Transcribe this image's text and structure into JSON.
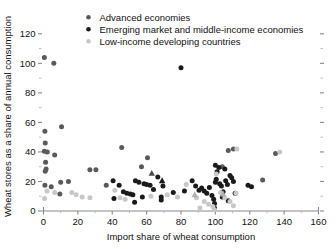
{
  "chart_data": {
    "type": "scatter",
    "title": "",
    "xlabel": "Import share of wheat consumption",
    "ylabel": "Wheat stores as a share of annual consumption",
    "xlim": [
      0,
      160
    ],
    "ylim": [
      0,
      128
    ],
    "xticks": [
      0,
      20,
      40,
      60,
      80,
      100,
      120,
      140,
      160
    ],
    "xticklabels": [
      "0",
      "20",
      "40",
      "60",
      "80",
      "100",
      "120",
      "140",
      "160"
    ],
    "yticks": [
      0,
      20,
      40,
      60,
      80,
      100,
      120
    ],
    "yticklabels": [
      "0",
      "20",
      "40",
      "60",
      "80",
      "100",
      "120"
    ],
    "y_minor_ticks": [
      10,
      30,
      50,
      70,
      90,
      110
    ],
    "grid": false,
    "legend_position": "top-center",
    "colors": {
      "advanced": "#5a5a5a",
      "emerging": "#1a1a1a",
      "lowincome": "#c8c8c8",
      "axis": "#8a8a8a",
      "text": "#111111"
    },
    "legend": [
      {
        "label": "Advanced economies",
        "marker": "circle",
        "color": "#5a5a5a"
      },
      {
        "label": "Emerging market and middle-income economies",
        "marker": "circle",
        "color": "#1a1a1a"
      },
      {
        "label": "Low-income developing countries",
        "marker": "circle",
        "color": "#c8c8c8"
      }
    ],
    "series": [
      {
        "name": "Advanced economies",
        "marker": "circle",
        "color": "#5a5a5a",
        "points": [
          [
            0.5,
            104
          ],
          [
            6.0,
            100
          ],
          [
            0.8,
            54
          ],
          [
            10.5,
            57
          ],
          [
            1.0,
            46
          ],
          [
            0.5,
            40.5
          ],
          [
            2.2,
            40
          ],
          [
            6.5,
            38
          ],
          [
            1.2,
            33
          ],
          [
            1.5,
            28.5
          ],
          [
            1.0,
            27
          ],
          [
            0.8,
            17.5
          ],
          [
            4.5,
            16.5
          ],
          [
            10.0,
            19.5
          ],
          [
            14.5,
            20
          ],
          [
            9.5,
            11.5
          ],
          [
            27.0,
            28
          ],
          [
            30.5,
            28
          ],
          [
            36.5,
            17.5
          ],
          [
            45.5,
            43
          ],
          [
            57.0,
            30
          ],
          [
            60.5,
            36
          ],
          [
            104.0,
            30
          ],
          [
            110.5,
            42
          ],
          [
            107.5,
            41
          ],
          [
            135.0,
            39
          ],
          [
            127.5,
            21
          ]
        ]
      },
      {
        "name": "Emerging market and middle-income economies",
        "marker": "circle",
        "color": "#1a1a1a",
        "points": [
          [
            80.0,
            97
          ],
          [
            40.5,
            20.5
          ],
          [
            44.0,
            17.5
          ],
          [
            41.0,
            8.5
          ],
          [
            46.5,
            13.0
          ],
          [
            48.5,
            12.0
          ],
          [
            50.5,
            11.5
          ],
          [
            52.0,
            11.0
          ],
          [
            53.5,
            20.5
          ],
          [
            55.5,
            19.5
          ],
          [
            57.5,
            9.5
          ],
          [
            53.0,
            6.0
          ],
          [
            58.5,
            18.5
          ],
          [
            60.0,
            18.0
          ],
          [
            62.0,
            17.5
          ],
          [
            64.0,
            14.5
          ],
          [
            66.5,
            23.0
          ],
          [
            68.5,
            9.5
          ],
          [
            68.5,
            7.5
          ],
          [
            69.5,
            17.0
          ],
          [
            75.5,
            12.5
          ],
          [
            82.0,
            13.5
          ],
          [
            86.5,
            20.5
          ],
          [
            88.5,
            17.0
          ],
          [
            90.5,
            14.0
          ],
          [
            92.0,
            15.5
          ],
          [
            93.5,
            13.5
          ],
          [
            95.0,
            12.0
          ],
          [
            96.5,
            16.0
          ],
          [
            98.0,
            10.5
          ],
          [
            99.0,
            8.0
          ],
          [
            99.5,
            5.0
          ],
          [
            99.5,
            2.0
          ],
          [
            100.0,
            19.5
          ],
          [
            100.5,
            21.5
          ],
          [
            101.0,
            26.5
          ],
          [
            102.5,
            18.5
          ],
          [
            103.5,
            17.0
          ],
          [
            104.5,
            13.0
          ],
          [
            105.5,
            28.5
          ],
          [
            106.0,
            20.5
          ],
          [
            107.0,
            18.0
          ],
          [
            108.5,
            24.0
          ],
          [
            109.5,
            22.5
          ],
          [
            110.5,
            20.0
          ],
          [
            111.5,
            12.0
          ],
          [
            104.0,
            9.5
          ],
          [
            107.5,
            7.0
          ],
          [
            119.0,
            17.5
          ],
          [
            121.0,
            16.5
          ],
          [
            100.0,
            31.0
          ],
          [
            102.0,
            29.5
          ]
        ]
      },
      {
        "name": "Low-income developing countries",
        "marker": "circle",
        "color": "#c8c8c8",
        "points": [
          [
            2.0,
            13.5
          ],
          [
            0.6,
            8.5
          ],
          [
            6.5,
            12.5
          ],
          [
            16.5,
            12.5
          ],
          [
            19.0,
            11.0
          ],
          [
            22.5,
            9.5
          ],
          [
            27.0,
            9.0
          ],
          [
            41.5,
            14.0
          ],
          [
            44.5,
            9.0
          ],
          [
            47.5,
            8.0
          ],
          [
            62.5,
            10.0
          ],
          [
            72.0,
            11.0
          ],
          [
            78.0,
            9.5
          ],
          [
            83.0,
            18.0
          ],
          [
            89.0,
            9.0
          ],
          [
            93.5,
            6.5
          ],
          [
            96.0,
            4.5
          ],
          [
            98.5,
            3.0
          ],
          [
            100.5,
            25.0
          ],
          [
            103.0,
            12.5
          ],
          [
            105.5,
            9.0
          ],
          [
            108.5,
            6.5
          ],
          [
            110.5,
            3.5
          ],
          [
            112.0,
            12.0
          ],
          [
            137.5,
            40.0
          ],
          [
            112.5,
            42.0
          ],
          [
            99.5,
            0.8
          ],
          [
            91.0,
            2.0
          ]
        ]
      },
      {
        "name": "Group averages",
        "marker": "triangle",
        "points": [
          [
            63.0,
            25.5,
            "#4a4a4a"
          ],
          [
            69.0,
            20.5,
            "#1a1a1a"
          ],
          [
            88.0,
            11.0,
            "#b0b0b0"
          ],
          [
            104.5,
            11.5,
            "#b0b0b0"
          ]
        ]
      }
    ]
  }
}
